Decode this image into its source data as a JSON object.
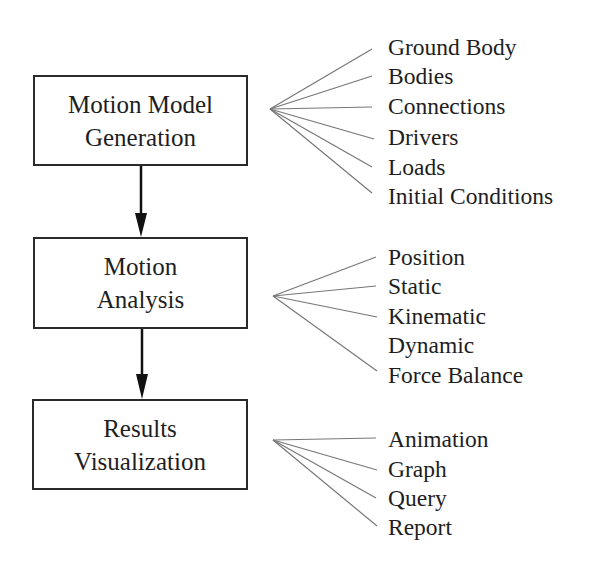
{
  "diagram": {
    "stages": [
      {
        "line1": "Motion Model",
        "line2": "Generation",
        "items": [
          "Ground Body",
          "Bodies",
          "Connections",
          "Drivers",
          "Loads",
          "Initial Conditions"
        ]
      },
      {
        "line1": "Motion",
        "line2": "Analysis",
        "items": [
          "Position",
          "Static",
          "Kinematic",
          "Dynamic",
          "Force Balance"
        ]
      },
      {
        "line1": "Results",
        "line2": "Visualization",
        "items": [
          "Animation",
          "Graph",
          "Query",
          "Report"
        ]
      }
    ]
  }
}
